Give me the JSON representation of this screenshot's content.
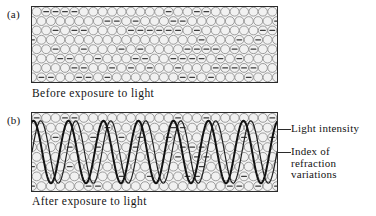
{
  "figure": {
    "panels": [
      {
        "tag": "(a)",
        "caption": "Before exposure to light",
        "state": "unexposed",
        "has_waves": false
      },
      {
        "tag": "(b)",
        "caption": "After exposure to light",
        "state": "exposed",
        "has_waves": true
      }
    ],
    "annotations": [
      {
        "label": "Light intensity"
      },
      {
        "label_line1": "Index of",
        "label_line2": "refraction",
        "label_line3": "variations"
      }
    ]
  },
  "chart_data": {
    "type": "line",
    "title": "",
    "xlabel": "",
    "ylabel": "",
    "panel_a": {
      "caption": "Before exposure to light",
      "grain_rows": 8,
      "grain_cols": 26,
      "grain_diameter_px": 9.5,
      "marked_fraction": 0.3,
      "series": []
    },
    "panel_b": {
      "caption": "After exposure to light",
      "grain_rows": 8,
      "grain_cols": 26,
      "grain_diameter_px": 9.5,
      "marked_fraction": 0.3,
      "cycles": 7,
      "x_range": [
        0,
        7
      ],
      "y_range": [
        -1,
        1
      ],
      "series": [
        {
          "name": "Light intensity",
          "waveform": "sinusoid",
          "cycles": 7,
          "amplitude": 1.0,
          "phase_deg": 0,
          "stroke_width": 1.2,
          "color": "#1f1f1f"
        },
        {
          "name": "Index of refraction variations",
          "waveform": "sinusoid",
          "cycles": 7,
          "amplitude": 1.0,
          "phase_deg": 75,
          "stroke_width": 2.0,
          "color": "#121212"
        }
      ],
      "legend": [
        "Light intensity",
        "Index of refraction variations"
      ],
      "legend_position": "right",
      "grid": false
    },
    "colors": {
      "grain_fill": "#f1f1f1",
      "grain_stroke": "#8a8a8a",
      "grain_mark": "#3d3d3d",
      "box_stroke": "#2b2b2b",
      "box_fill": "#f3f3f3",
      "wave_thin": "#1f1f1f",
      "wave_thick": "#121212",
      "text": "#141414",
      "background": "#ffffff"
    }
  }
}
